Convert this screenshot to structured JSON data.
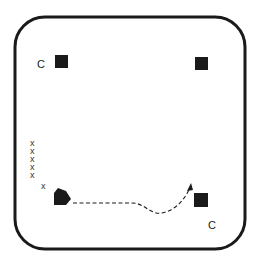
{
  "diagram": {
    "type": "drill-diagram",
    "colors": {
      "stroke": "#1a1a1a",
      "cone": "#1a1a1a",
      "background": "#ffffff"
    },
    "labels": {
      "coach_top_left": "C",
      "coach_bottom_right": "C",
      "player_mark": "x"
    },
    "player_line": [
      "x",
      "x",
      "x",
      "x",
      "x"
    ],
    "active_player": "x",
    "markers": [
      {
        "name": "cone-top-left",
        "x": 55,
        "y": 55
      },
      {
        "name": "cone-top-right",
        "x": 195,
        "y": 57
      },
      {
        "name": "cone-bottom-right",
        "x": 194,
        "y": 193
      }
    ],
    "path": {
      "style": "dashed",
      "arrow": true
    }
  }
}
